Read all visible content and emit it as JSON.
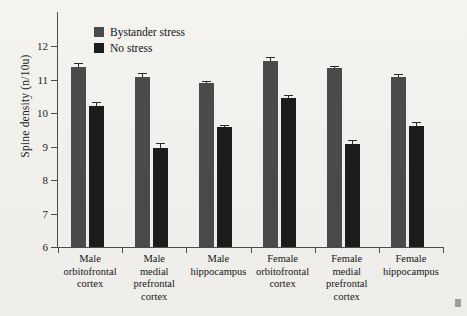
{
  "chart_data": {
    "type": "bar",
    "title": "",
    "xlabel": "",
    "ylabel": "Spine density (n/10u)",
    "ylim": [
      6,
      12
    ],
    "yticks": [
      6,
      7,
      8,
      9,
      10,
      11,
      12
    ],
    "grid": false,
    "legend_position": "top-left",
    "categories": [
      "Male orbitofrontal cortex",
      "Male medial prefrontal cortex",
      "Male hippocampus",
      "Female orbitofrontal cortex",
      "Female medial prefrontal cortex",
      "Female hippocampus"
    ],
    "category_lines": [
      [
        "Male",
        "orbitofrontal",
        "cortex"
      ],
      [
        "Male",
        "medial",
        "prefrontal",
        "cortex"
      ],
      [
        "Male",
        "hippocampus"
      ],
      [
        "Female",
        "orbitofrontal",
        "cortex"
      ],
      [
        "Female",
        "medial",
        "prefrontal",
        "cortex"
      ],
      [
        "Female",
        "hippocampus"
      ]
    ],
    "series": [
      {
        "name": "Bystander stress",
        "color": "#4a4a4a",
        "values": [
          11.37,
          11.06,
          10.89,
          11.56,
          11.33,
          11.08
        ],
        "errors": [
          0.11,
          0.13,
          0.08,
          0.1,
          0.08,
          0.08
        ]
      },
      {
        "name": "No stress",
        "color": "#1c1c1c",
        "values": [
          10.22,
          8.97,
          9.57,
          10.45,
          9.07,
          9.62
        ],
        "errors": [
          0.1,
          0.12,
          0.08,
          0.1,
          0.12,
          0.1
        ]
      }
    ]
  },
  "legend": {
    "items": [
      {
        "label": "Bystander stress",
        "key": "bystander"
      },
      {
        "label": "No stress",
        "key": "nostress"
      }
    ]
  },
  "axis": {
    "y_title": "Spine density (n/10u)",
    "y_tick_labels": [
      "12",
      "11",
      "10",
      "9",
      "8",
      "7",
      "6"
    ]
  }
}
